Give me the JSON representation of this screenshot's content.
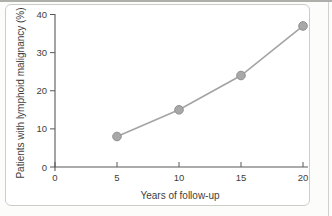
{
  "figure": {
    "kind": "scanned textbook line chart"
  },
  "chart_data": {
    "type": "line",
    "x": [
      5,
      10,
      15,
      20
    ],
    "y": [
      8,
      15,
      24,
      37
    ],
    "series_name": "Patients with lymphoid malignancy",
    "title": "",
    "xlabel": "Years of follow-up",
    "ylabel": "Patients with lymphoid malignancy (%)",
    "xticks": [
      0,
      5,
      10,
      15,
      20
    ],
    "yticks": [
      0,
      10,
      20,
      30,
      40
    ],
    "xlim": [
      0,
      20
    ],
    "ylim": [
      0,
      40
    ],
    "grid": false,
    "legend": null,
    "marker": "circle"
  },
  "colors": {
    "page_background": "#fcfcfa",
    "figure_background": "#ffffff",
    "figure_border": "#cdcdc8",
    "top_rule": "#aeaeaa",
    "page_edge": "#d2d2cc",
    "axis": "#58585a",
    "tick_text": "#3e3e40",
    "line": "#a4a4a4",
    "marker_fill": "#a8a8a8",
    "marker_edge": "#8e8e8e"
  }
}
